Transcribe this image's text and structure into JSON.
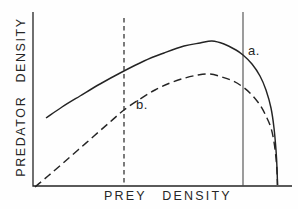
{
  "figure": {
    "background": "#fefefe",
    "ink": "#242424",
    "reference_line_color": "#4a4a4a"
  },
  "chart_data": {
    "type": "line",
    "title": "",
    "xlabel": "PREY DENSITY",
    "ylabel": "PREDATOR DENSITY",
    "x_axis": {
      "range_px": [
        33,
        292
      ],
      "ticks": [],
      "grid": false
    },
    "y_axis": {
      "range_px": [
        12,
        186
      ],
      "ticks": [],
      "grid": false
    },
    "legend": "none",
    "series": [
      {
        "id": "a",
        "name": "a.",
        "style": "solid",
        "points_px": [
          [
            46,
            118
          ],
          [
            62,
            107
          ],
          [
            80,
            96
          ],
          [
            100,
            84
          ],
          [
            122,
            72
          ],
          [
            144,
            61
          ],
          [
            164,
            53
          ],
          [
            184,
            46
          ],
          [
            200,
            43
          ],
          [
            212,
            41
          ],
          [
            224,
            44
          ],
          [
            236,
            50
          ],
          [
            243,
            55
          ],
          [
            252,
            64
          ],
          [
            260,
            76
          ],
          [
            266,
            90
          ],
          [
            271,
            108
          ],
          [
            274,
            128
          ],
          [
            276,
            150
          ],
          [
            277,
            168
          ],
          [
            277.5,
            185
          ]
        ]
      },
      {
        "id": "b",
        "name": "b.",
        "style": "dashed",
        "points_px": [
          [
            35,
            187
          ],
          [
            48,
            176
          ],
          [
            62,
            164
          ],
          [
            78,
            150
          ],
          [
            94,
            136
          ],
          [
            110,
            122
          ],
          [
            124,
            110
          ],
          [
            140,
            99
          ],
          [
            155,
            90
          ],
          [
            170,
            83
          ],
          [
            185,
            78
          ],
          [
            198,
            75
          ],
          [
            210,
            74
          ],
          [
            222,
            77
          ],
          [
            233,
            81
          ],
          [
            243,
            87
          ],
          [
            252,
            95
          ],
          [
            260,
            105
          ],
          [
            266,
            116
          ],
          [
            271,
            128
          ],
          [
            274,
            142
          ],
          [
            276,
            158
          ],
          [
            277,
            172
          ],
          [
            277.5,
            185
          ]
        ]
      }
    ],
    "reference_lines": [
      {
        "name": "dashed-vertical-reference-line",
        "style": "dashed",
        "x_px": 124,
        "y1_px": 18,
        "y2_px": 186
      },
      {
        "name": "solid-vertical-reference-line",
        "style": "solid",
        "x_px": 243,
        "y1_px": 12,
        "y2_px": 186
      }
    ],
    "annotations": [
      {
        "label": "a.",
        "x_px": 248,
        "y_px": 43
      },
      {
        "label": "b.",
        "x_px": 136,
        "y_px": 97
      }
    ]
  }
}
